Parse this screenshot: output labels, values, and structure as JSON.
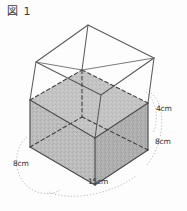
{
  "figure": {
    "title": "図 1",
    "caption_icon": "figure-label-icon",
    "shape": "open-top rectangular box partially filled",
    "fill_description": "gray shaded liquid",
    "colors": {
      "background": "#fdfdfd",
      "outline": "#5a5a5a",
      "hidden_edge": "#3f3f3f",
      "fill_gray": "#b9b9b9",
      "fill_gray_dark": "#a8a8a8",
      "guide_dotted": "#9a9a9a",
      "label_text": "#2e2e2e"
    },
    "dimensions": [
      {
        "id": "top-gap",
        "value": "4cm",
        "position": "upper-right",
        "meaning": "empty height above fill"
      },
      {
        "id": "fill-depth",
        "value": "8cm",
        "position": "lower-right",
        "meaning": "depth of shaded fill"
      },
      {
        "id": "side-width",
        "value": "8cm",
        "position": "left",
        "meaning": "box width"
      },
      {
        "id": "base-length",
        "value": "15cm",
        "position": "bottom",
        "meaning": "box length"
      }
    ],
    "labels": {
      "top_gap": "4cm",
      "fill_depth": "8cm",
      "side_width": "8cm",
      "base_length": "15cm"
    }
  }
}
